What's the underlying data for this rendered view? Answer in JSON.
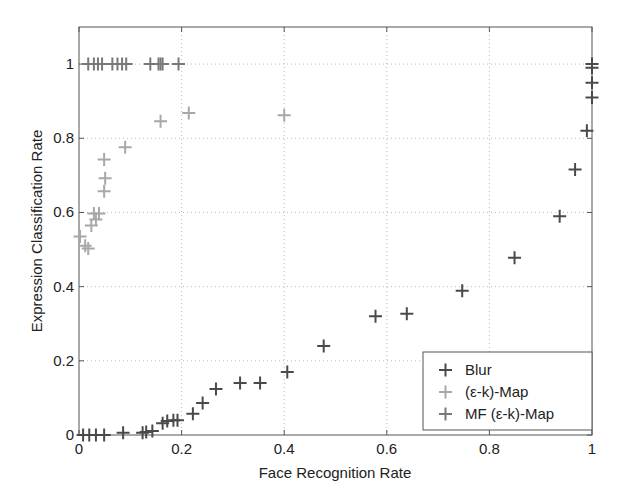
{
  "chart_data": {
    "type": "scatter",
    "title": "",
    "xlabel": "Face Recognition Rate",
    "ylabel": "Expression Classification Rate",
    "xlim": [
      0,
      1
    ],
    "ylim": [
      0,
      1.1
    ],
    "xticks": [
      0,
      0.2,
      0.4,
      0.6,
      0.8,
      1
    ],
    "xtick_labels": [
      "0",
      "0.2",
      "0.4",
      "0.6",
      "0.8",
      "1"
    ],
    "yticks": [
      0,
      0.2,
      0.4,
      0.6,
      0.8,
      1
    ],
    "ytick_labels": [
      "0",
      "0.2",
      "0.4",
      "0.6",
      "0.8",
      "1"
    ],
    "grid": true,
    "legend_position": "lower right",
    "marker": "+",
    "series": [
      {
        "name": "Blur",
        "color": "#4a4a4a",
        "points": [
          [
            0.008,
            0.0
          ],
          [
            0.02,
            0.0
          ],
          [
            0.033,
            0.0
          ],
          [
            0.049,
            0.0
          ],
          [
            0.086,
            0.006
          ],
          [
            0.124,
            0.006
          ],
          [
            0.131,
            0.008
          ],
          [
            0.143,
            0.011
          ],
          [
            0.163,
            0.032
          ],
          [
            0.172,
            0.038
          ],
          [
            0.184,
            0.04
          ],
          [
            0.192,
            0.04
          ],
          [
            0.222,
            0.057
          ],
          [
            0.241,
            0.086
          ],
          [
            0.267,
            0.124
          ],
          [
            0.314,
            0.14
          ],
          [
            0.353,
            0.14
          ],
          [
            0.406,
            0.17
          ],
          [
            0.477,
            0.24
          ],
          [
            0.578,
            0.32
          ],
          [
            0.639,
            0.327
          ],
          [
            0.747,
            0.389
          ],
          [
            0.849,
            0.478
          ],
          [
            0.937,
            0.59
          ],
          [
            0.967,
            0.716
          ],
          [
            0.99,
            0.82
          ],
          [
            1.0,
            0.91
          ],
          [
            1.0,
            0.95
          ],
          [
            1.0,
            0.99
          ],
          [
            1.0,
            1.0
          ]
        ]
      },
      {
        "name": "(ε-k)-Map",
        "color": "#a8a8a8",
        "points": [
          [
            0.002,
            0.535
          ],
          [
            0.012,
            0.51
          ],
          [
            0.018,
            0.503
          ],
          [
            0.024,
            0.565
          ],
          [
            0.033,
            0.581
          ],
          [
            0.029,
            0.597
          ],
          [
            0.039,
            0.597
          ],
          [
            0.049,
            0.657
          ],
          [
            0.051,
            0.692
          ],
          [
            0.049,
            0.743
          ],
          [
            0.09,
            0.776
          ],
          [
            0.159,
            0.846
          ],
          [
            0.214,
            0.868
          ],
          [
            0.4,
            0.862
          ]
        ]
      },
      {
        "name": "MF (ε-k)-Map",
        "color": "#787878",
        "points": [
          [
            0.018,
            1.0
          ],
          [
            0.029,
            1.0
          ],
          [
            0.037,
            1.0
          ],
          [
            0.045,
            1.0
          ],
          [
            0.065,
            1.0
          ],
          [
            0.075,
            1.0
          ],
          [
            0.084,
            1.0
          ],
          [
            0.092,
            1.0
          ],
          [
            0.139,
            1.0
          ],
          [
            0.155,
            1.0
          ],
          [
            0.159,
            1.0
          ],
          [
            0.163,
            1.0
          ],
          [
            0.194,
            1.0
          ]
        ]
      }
    ]
  },
  "legend": {
    "items": [
      {
        "label": "Blur",
        "color": "#4a4a4a"
      },
      {
        "label": "(ε-k)-Map",
        "color": "#a8a8a8"
      },
      {
        "label": "MF (ε-k)-Map",
        "color": "#787878"
      }
    ]
  }
}
